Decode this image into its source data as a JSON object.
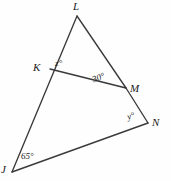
{
  "figure": {
    "kind": "geometry-diagram",
    "stroke_color": "#3a3a3a",
    "background_color": "#fefefe",
    "text_color": "#1b1b1b",
    "vertices": [
      {
        "name": "L",
        "label": "L",
        "x": 77,
        "y": 16,
        "label_x": 73,
        "label_y": 1
      },
      {
        "name": "K",
        "label": "K",
        "x": 50,
        "y": 69,
        "label_x": 33,
        "label_y": 62
      },
      {
        "name": "M",
        "label": "M",
        "x": 126,
        "y": 88,
        "label_x": 130,
        "label_y": 83
      },
      {
        "name": "N",
        "label": "N",
        "x": 148,
        "y": 123,
        "label_x": 152,
        "label_y": 117
      },
      {
        "name": "J",
        "label": "J",
        "x": 12,
        "y": 172,
        "label_x": 1,
        "label_y": 164
      }
    ],
    "segments": [
      {
        "name": "segment-JL",
        "from": "J",
        "to": "L"
      },
      {
        "name": "segment-LM",
        "from": "L",
        "to": "M"
      },
      {
        "name": "segment-MN",
        "from": "M",
        "to": "N"
      },
      {
        "name": "segment-JN",
        "from": "J",
        "to": "N"
      },
      {
        "name": "segment-KM",
        "from": "K",
        "to": "M"
      }
    ],
    "angles": [
      {
        "name": "angle-at-K",
        "label": "z°",
        "value": "z",
        "unit": "degrees",
        "at_vertex": "K",
        "label_x": 55,
        "label_y": 59
      },
      {
        "name": "angle-at-M-upper",
        "label": "30°",
        "value": "30",
        "unit": "degrees",
        "at_vertex": "M",
        "label_x": 91,
        "label_y": 76
      },
      {
        "name": "angle-at-M-lower",
        "label": "y°",
        "value": "y",
        "unit": "degrees",
        "at_vertex": "M",
        "label_x": 126,
        "label_y": 113
      },
      {
        "name": "angle-at-J",
        "label": "65°",
        "value": "65",
        "unit": "degrees",
        "at_vertex": "J",
        "label_x": 21,
        "label_y": 152
      }
    ]
  }
}
